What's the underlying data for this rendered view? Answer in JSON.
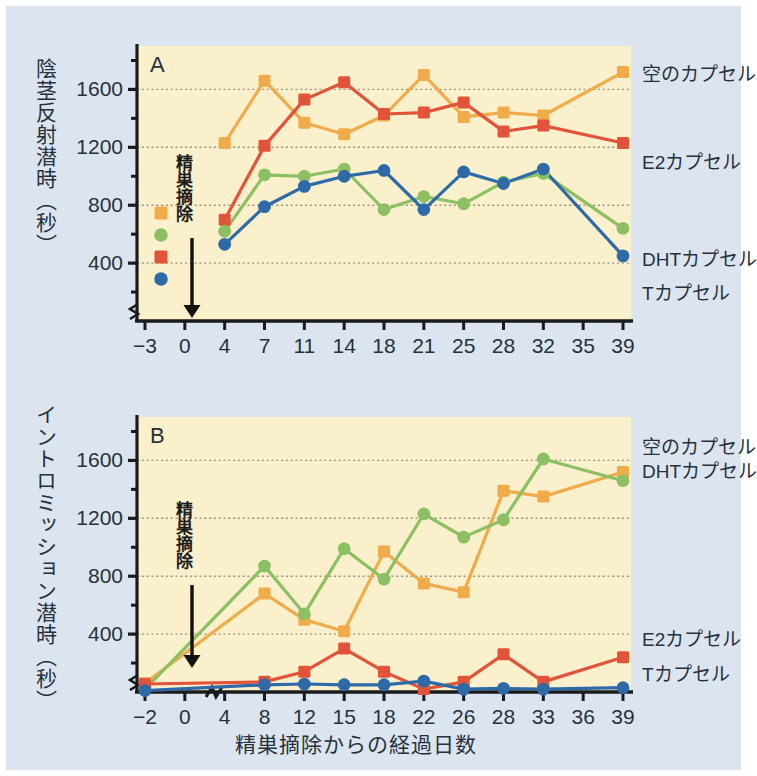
{
  "figure": {
    "background": "#dce5ef",
    "plot_background": "#fbf0cc",
    "xlabel": "精巣摘除からの経過日数",
    "colors": {
      "empty": "#f0ab4a",
      "e2": "#e2533a",
      "dht": "#8cc063",
      "t": "#2f6aa8",
      "grid": "#9a9a8a",
      "axis": "#1a1a1a",
      "text": "#26313d"
    },
    "series_names": {
      "empty": "空のカプセル",
      "e2": "E2カプセル",
      "dht": "DHTカプセル",
      "t": "Tカプセル"
    },
    "annotation": "精巣摘除"
  },
  "chart_data": [
    {
      "type": "line",
      "panel": "A",
      "title": "A",
      "ylabel": "陰茎反射潜時（秒）",
      "xlabel": "精巣摘除からの経過日数",
      "ylim": [
        0,
        1900
      ],
      "yticks": [
        400,
        800,
        1200,
        1600
      ],
      "yticks_minor": [
        200,
        600,
        1000,
        1400,
        1800
      ],
      "grid": true,
      "xticks": [
        "-3",
        "0",
        "4",
        "7",
        "11",
        "14",
        "18",
        "21",
        "25",
        "28",
        "32",
        "35",
        "39"
      ],
      "legend_position": "right",
      "axis_break": true,
      "series": [
        {
          "name": "空のカプセル",
          "key": "empty",
          "color": "#f0ab4a",
          "marker": "square",
          "x": [
            "4",
            "7",
            "11",
            "14",
            "18",
            "21",
            "25",
            "28",
            "32",
            "39"
          ],
          "values": [
            1230,
            1660,
            1370,
            1290,
            1420,
            1700,
            1410,
            1440,
            1420,
            1720
          ]
        },
        {
          "name": "E2カプセル",
          "key": "e2",
          "color": "#e2533a",
          "marker": "square",
          "x": [
            "4",
            "7",
            "11",
            "14",
            "18",
            "21",
            "25",
            "28",
            "32",
            "39"
          ],
          "values": [
            700,
            1210,
            1530,
            1650,
            1430,
            1440,
            1510,
            1310,
            1350,
            1230
          ]
        },
        {
          "name": "DHTカプセル",
          "key": "dht",
          "color": "#8cc063",
          "marker": "circle",
          "x": [
            "4",
            "7",
            "11",
            "14",
            "18",
            "21",
            "25",
            "28",
            "32",
            "39"
          ],
          "values": [
            620,
            1010,
            1000,
            1050,
            770,
            860,
            810,
            960,
            1020,
            640
          ]
        },
        {
          "name": "Tカプセル",
          "key": "t",
          "color": "#2f6aa8",
          "marker": "circle",
          "x": [
            "4",
            "7",
            "11",
            "14",
            "18",
            "21",
            "25",
            "28",
            "32",
            "39"
          ],
          "values": [
            530,
            790,
            930,
            1000,
            1040,
            770,
            1030,
            950,
            1050,
            450
          ]
        }
      ]
    },
    {
      "type": "line",
      "panel": "B",
      "title": "B",
      "ylabel": "イントロミッション潜時（秒）",
      "xlabel": "精巣摘除からの経過日数",
      "ylim": [
        0,
        1900
      ],
      "yticks": [
        400,
        800,
        1200,
        1600
      ],
      "yticks_minor": [
        200,
        600,
        1000,
        1400,
        1800
      ],
      "grid": true,
      "xticks": [
        "-2",
        "0",
        "4",
        "8",
        "12",
        "15",
        "18",
        "22",
        "26",
        "28",
        "33",
        "36",
        "39"
      ],
      "legend_position": "right",
      "axis_break": true,
      "series": [
        {
          "name": "空のカプセル",
          "key": "empty",
          "color": "#f0ab4a",
          "marker": "square",
          "x": [
            "-2",
            "8",
            "12",
            "15",
            "18",
            "22",
            "26",
            "28",
            "33",
            "39"
          ],
          "values": [
            60,
            680,
            500,
            420,
            970,
            750,
            690,
            1390,
            1350,
            1520
          ]
        },
        {
          "name": "DHTカプセル",
          "key": "dht",
          "color": "#8cc063",
          "marker": "circle",
          "x": [
            "-2",
            "8",
            "12",
            "15",
            "18",
            "22",
            "26",
            "28",
            "33",
            "39"
          ],
          "values": [
            20,
            870,
            540,
            990,
            780,
            1230,
            1070,
            1190,
            1610,
            1460
          ]
        },
        {
          "name": "E2カプセル",
          "key": "e2",
          "color": "#e2533a",
          "marker": "square",
          "x": [
            "-2",
            "8",
            "12",
            "15",
            "18",
            "22",
            "26",
            "28",
            "33",
            "39"
          ],
          "values": [
            55,
            70,
            140,
            300,
            140,
            20,
            70,
            260,
            70,
            240
          ]
        },
        {
          "name": "Tカプセル",
          "key": "t",
          "color": "#2f6aa8",
          "marker": "circle",
          "x": [
            "-2",
            "8",
            "12",
            "15",
            "18",
            "22",
            "26",
            "28",
            "33",
            "39"
          ],
          "values": [
            10,
            50,
            55,
            50,
            50,
            75,
            20,
            25,
            20,
            30
          ]
        }
      ]
    }
  ]
}
